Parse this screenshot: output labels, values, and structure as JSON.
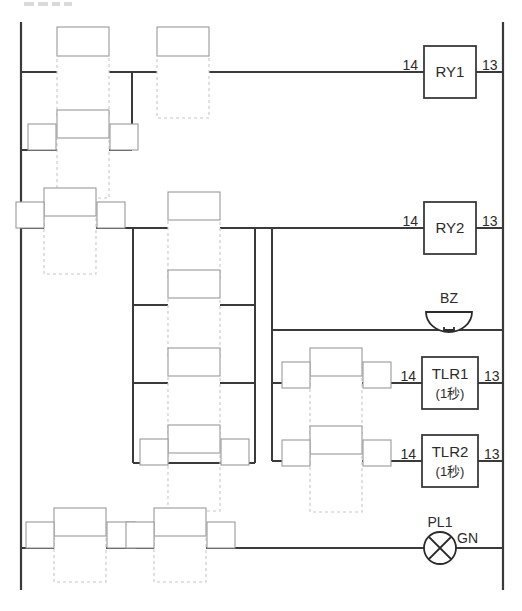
{
  "diagram": {
    "kind": "ladder-diagram",
    "title_fragment": "",
    "language_note": "(1秒)",
    "colors": {
      "wire": "#3a3a3a",
      "ghost": "#c8c8c8",
      "label_box": "#9a9a9a",
      "text": "#2b2b2b",
      "background": "#ffffff"
    },
    "canvas": {
      "width": 522,
      "height": 611
    },
    "rails": {
      "left_x": 21,
      "right_x": 503,
      "top_y": 22,
      "bottom_y": 590
    },
    "devices": [
      {
        "id": "RY1",
        "type": "relay-coil",
        "label": "RY1",
        "sublabel": "",
        "terminal_left": "14",
        "terminal_right": "13",
        "rung_y": 72,
        "box": {
          "x": 424,
          "y": 46,
          "w": 52,
          "h": 52
        }
      },
      {
        "id": "RY2",
        "type": "relay-coil",
        "label": "RY2",
        "sublabel": "",
        "terminal_left": "14",
        "terminal_right": "13",
        "rung_y": 228,
        "box": {
          "x": 424,
          "y": 202,
          "w": 52,
          "h": 52
        }
      },
      {
        "id": "BZ",
        "type": "buzzer",
        "label": "BZ",
        "sublabel": "",
        "terminal_left": "",
        "terminal_right": "",
        "rung_y": 330,
        "box": {
          "x": 426,
          "y": 306,
          "w": 46,
          "h": 22
        }
      },
      {
        "id": "TLR1",
        "type": "timer-relay-coil",
        "label": "TLR1",
        "sublabel": "(1秒)",
        "terminal_left": "14",
        "terminal_right": "13",
        "rung_y": 383,
        "box": {
          "x": 422,
          "y": 357,
          "w": 56,
          "h": 52
        }
      },
      {
        "id": "TLR2",
        "type": "timer-relay-coil",
        "label": "TLR2",
        "sublabel": "(1秒)",
        "terminal_left": "14",
        "terminal_right": "13",
        "rung_y": 461,
        "box": {
          "x": 422,
          "y": 435,
          "w": 56,
          "h": 52
        }
      },
      {
        "id": "PL1",
        "type": "pilot-lamp",
        "label": "PL1",
        "sublabel": "GN",
        "terminal_left": "",
        "terminal_right": "",
        "rung_y": 548,
        "box": {
          "x": 424,
          "y": 532,
          "w": 32,
          "h": 32
        }
      }
    ],
    "contacts": [
      {
        "id": "c-ry1-a",
        "rung_y": 72,
        "cx": 83,
        "label": "",
        "terminals": false
      },
      {
        "id": "c-ry1-b",
        "rung_y": 72,
        "cx": 183,
        "label": "",
        "terminals": false
      },
      {
        "id": "c-seal-1",
        "rung_y": 150,
        "cx": 83,
        "label": "",
        "terminals": true
      },
      {
        "id": "c-ry2-a",
        "rung_y": 228,
        "cx": 70,
        "label": "",
        "terminals": true
      },
      {
        "id": "c-mid-1",
        "rung_y": 228,
        "cx": 194,
        "label": "",
        "terminals": false
      },
      {
        "id": "c-mid-2",
        "rung_y": 305,
        "cx": 194,
        "label": "",
        "terminals": false
      },
      {
        "id": "c-mid-3",
        "rung_y": 383,
        "cx": 194,
        "label": "",
        "terminals": false
      },
      {
        "id": "c-mid-4",
        "rung_y": 461,
        "cx": 194,
        "label": "",
        "terminals": true
      },
      {
        "id": "c-tlr1",
        "rung_y": 383,
        "cx": 336,
        "label": "",
        "terminals": true
      },
      {
        "id": "c-tlr2",
        "rung_y": 461,
        "cx": 336,
        "label": "",
        "terminals": true
      },
      {
        "id": "c-pl-a",
        "rung_y": 548,
        "cx": 80,
        "label": "",
        "terminals": true
      },
      {
        "id": "c-pl-b",
        "rung_y": 548,
        "cx": 180,
        "label": "",
        "terminals": true
      }
    ],
    "branch_buses": [
      {
        "id": "bus-seal",
        "x": 132,
        "y1": 72,
        "y2": 150
      },
      {
        "id": "bus-mid",
        "x": 133,
        "y1": 228,
        "y2": 461
      },
      {
        "id": "bus-mid-r",
        "x": 255,
        "y1": 228,
        "y2": 461
      },
      {
        "id": "bus-right",
        "x": 272,
        "y1": 228,
        "y2": 461
      }
    ]
  }
}
